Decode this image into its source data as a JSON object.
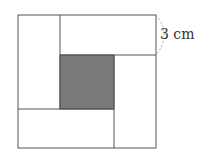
{
  "figure": {
    "dimension_label": "3 cm",
    "colors": {
      "outline": "#555555",
      "shaded": "#7a7a7a",
      "background": "#ffffff",
      "arc": "#aaaaaa"
    },
    "outer_square": {
      "x": 18,
      "y": 15,
      "w": 138,
      "h": 133
    },
    "rectangles": [
      {
        "name": "top",
        "x": 60,
        "y": 15,
        "w": 96,
        "h": 40
      },
      {
        "name": "right",
        "x": 114,
        "y": 55,
        "w": 42,
        "h": 93
      },
      {
        "name": "bottom",
        "x": 18,
        "y": 109,
        "w": 96,
        "h": 39
      },
      {
        "name": "left",
        "x": 18,
        "y": 15,
        "w": 42,
        "h": 94
      }
    ],
    "center_square": {
      "x": 60,
      "y": 55,
      "w": 54,
      "h": 54
    }
  }
}
